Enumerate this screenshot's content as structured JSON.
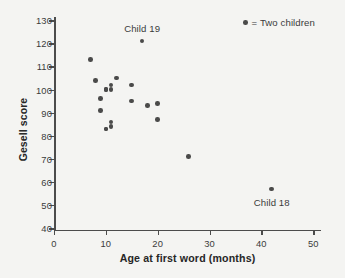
{
  "chart_data": {
    "type": "scatter",
    "title": "",
    "xlabel": "Age at first word (months)",
    "ylabel": "Gesell score",
    "xlim": [
      0,
      51.5
    ],
    "ylim": [
      40,
      130
    ],
    "grid": false,
    "legend_position": "top-right",
    "legend": [
      {
        "marker": "dot",
        "label": "= Two children"
      }
    ],
    "xticks": [
      0,
      10,
      20,
      30,
      40,
      50
    ],
    "xticklabels": [
      "0",
      "10",
      "20",
      "30",
      "40",
      "50"
    ],
    "yticks": [
      40,
      50,
      60,
      70,
      80,
      90,
      100,
      110,
      120,
      130
    ],
    "yticklabels": [
      "40",
      "50",
      "60",
      "70",
      "80",
      "90",
      "100",
      "110",
      "120",
      "130"
    ],
    "points": [
      {
        "x": 15,
        "y": 95
      },
      {
        "x": 26,
        "y": 71
      },
      {
        "x": 10,
        "y": 83
      },
      {
        "x": 9,
        "y": 91
      },
      {
        "x": 15,
        "y": 102
      },
      {
        "x": 20,
        "y": 87
      },
      {
        "x": 18,
        "y": 93
      },
      {
        "x": 11,
        "y": 100
      },
      {
        "x": 8,
        "y": 104
      },
      {
        "x": 20,
        "y": 94
      },
      {
        "x": 7,
        "y": 113
      },
      {
        "x": 9,
        "y": 96
      },
      {
        "x": 10,
        "y": 83
      },
      {
        "x": 11,
        "y": 84
      },
      {
        "x": 11,
        "y": 102
      },
      {
        "x": 10,
        "y": 100
      },
      {
        "x": 12,
        "y": 105
      },
      {
        "x": 42,
        "y": 57
      },
      {
        "x": 17,
        "y": 121
      },
      {
        "x": 11,
        "y": 86
      },
      {
        "x": 10,
        "y": 100
      }
    ],
    "annotations": [
      {
        "text": "Child 19",
        "x": 17,
        "y": 126,
        "refers_to": {
          "x": 17,
          "y": 121
        }
      },
      {
        "text": "Child 18",
        "x": 42,
        "y": 51,
        "refers_to": {
          "x": 42,
          "y": 57
        }
      }
    ]
  }
}
